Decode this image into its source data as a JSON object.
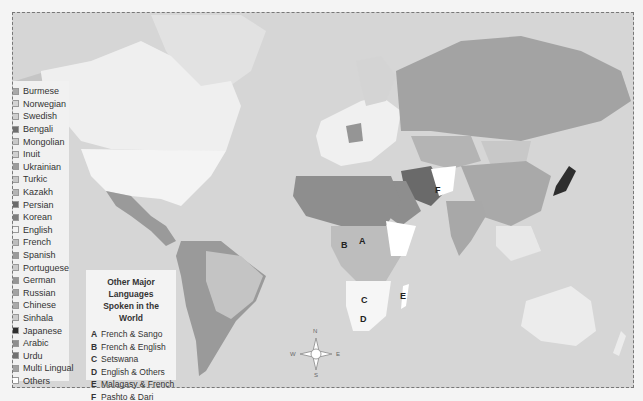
{
  "map": {
    "ocean_color": "#d6d6d6"
  },
  "legend": {
    "items": [
      {
        "label": "Burmese",
        "color": "#a8a8a8"
      },
      {
        "label": "Norwegian",
        "color": "#d4d4d4"
      },
      {
        "label": "Swedish",
        "color": "#cfcfcf"
      },
      {
        "label": "Bengali",
        "color": "#6e6e6e"
      },
      {
        "label": "Mongolian",
        "color": "#c8c8c8"
      },
      {
        "label": "Inuit",
        "color": "#d0d0d0"
      },
      {
        "label": "Ukrainian",
        "color": "#9c9c9c"
      },
      {
        "label": "Turkic",
        "color": "#c6c6c6"
      },
      {
        "label": "Kazakh",
        "color": "#b4b4b4"
      },
      {
        "label": "Persian",
        "color": "#6a6a6a"
      },
      {
        "label": "Korean",
        "color": "#7d7d7d"
      },
      {
        "label": "English",
        "color": "#f4f4f4"
      },
      {
        "label": "French",
        "color": "#bdbdbd"
      },
      {
        "label": "Spanish",
        "color": "#9a9a9a"
      },
      {
        "label": "Portuguese",
        "color": "#cacaca"
      },
      {
        "label": "German",
        "color": "#959595"
      },
      {
        "label": "Russian",
        "color": "#a3a3a3"
      },
      {
        "label": "Chinese",
        "color": "#a9a9a9"
      },
      {
        "label": "Sinhala",
        "color": "#cccccc"
      },
      {
        "label": "Japanese",
        "color": "#2e2e2e"
      },
      {
        "label": "Arabic",
        "color": "#8e8e8e"
      },
      {
        "label": "Urdu",
        "color": "#707070"
      },
      {
        "label": "Multi Lingual",
        "color": "#a0a0a0"
      },
      {
        "label": "Others",
        "color": "#ffffff"
      }
    ]
  },
  "other_languages": {
    "title_line1": "Other Major Languages",
    "title_line2": "Spoken in the World",
    "items": [
      {
        "key": "A",
        "label": "French & Sango"
      },
      {
        "key": "B",
        "label": "French & English"
      },
      {
        "key": "C",
        "label": "Setswana"
      },
      {
        "key": "D",
        "label": "English & Others"
      },
      {
        "key": "E",
        "label": "Malagasy & French"
      },
      {
        "key": "F",
        "label": "Pashto & Dari"
      }
    ]
  },
  "markers": [
    {
      "key": "A",
      "x": 359,
      "y": 236
    },
    {
      "key": "B",
      "x": 341,
      "y": 240
    },
    {
      "key": "C",
      "x": 361,
      "y": 295
    },
    {
      "key": "D",
      "x": 360,
      "y": 314
    },
    {
      "key": "E",
      "x": 400,
      "y": 291
    },
    {
      "key": "F",
      "x": 435,
      "y": 185
    }
  ],
  "compass": {
    "n": "N",
    "s": "S",
    "e": "E",
    "w": "W"
  }
}
